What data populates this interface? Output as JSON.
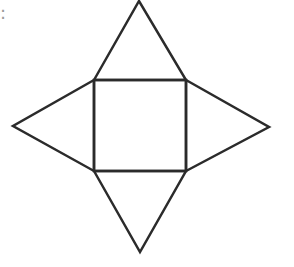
{
  "diagram": {
    "cut_label": ":",
    "stroke_color": "#2b2b2b",
    "background": "#ffffff",
    "square": {
      "x1": 94,
      "y1": 80,
      "x2": 186,
      "y2": 171
    },
    "triangles": [
      {
        "name": "top",
        "apex": [
          139,
          1
        ]
      },
      {
        "name": "left",
        "apex": [
          13,
          126
        ]
      },
      {
        "name": "right",
        "apex": [
          269,
          127
        ]
      },
      {
        "name": "bottom",
        "apex": [
          140,
          252
        ]
      }
    ]
  }
}
